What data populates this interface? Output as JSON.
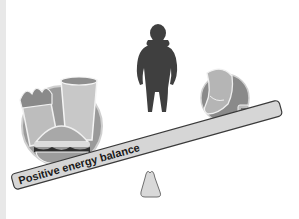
{
  "diagram": {
    "beam_label": "Positive energy balance",
    "left_side": {
      "icon": "fast-food-icon",
      "items": [
        "fries",
        "drink-cup",
        "hamburger"
      ]
    },
    "center": {
      "icon": "person-silhouette-icon"
    },
    "right_side": {
      "icon": "exercise-icon",
      "items": [
        "running-shoe",
        "music-player"
      ]
    },
    "fulcrum": {
      "icon": "triangle-fulcrum-icon"
    },
    "colors": {
      "background": "#ffffff",
      "beam_fill": "#d6d6d6",
      "beam_stroke": "#3a3a3a",
      "silhouette": "#3f3f3f",
      "fulcrum_fill": "#d9d9d9"
    }
  }
}
